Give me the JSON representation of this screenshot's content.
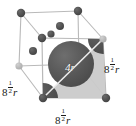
{
  "figure": {
    "type": "crystal-structure-diagram",
    "width": 136,
    "height": 126
  },
  "labels": {
    "edge_left": {
      "base": "8",
      "numerator": "1",
      "denominator": "2",
      "variable": "r",
      "full": "8^(1/2) r"
    },
    "edge_right": {
      "base": "8",
      "numerator": "1",
      "denominator": "2",
      "variable": "r",
      "full": "8^(1/2) r"
    },
    "edge_bottom": {
      "base": "8",
      "numerator": "1",
      "denominator": "2",
      "variable": "r",
      "full": "8^(1/2) r"
    },
    "diagonal": "4r"
  },
  "colors": {
    "cube_edge": "#b9b9b9",
    "cube_edge_dark": "#9a9a9a",
    "corner_atom_dark": "#4a4a4a",
    "corner_atom_light": "#b3b3b3",
    "interior_atom": "#5a5a5a",
    "central_sphere": "#575757",
    "quarter_sphere": "#4f4f4f",
    "shaded_face": "#c9c9c9",
    "diagonal_line": "#e8e8e8",
    "background": "#ffffff",
    "text": "#1a1a1a",
    "diagonal_text": "#ffffff"
  },
  "geometry": {
    "cube_vertices": {
      "back_top_left": [
        21,
        13
      ],
      "back_top_right": [
        78,
        11
      ],
      "back_bottom_left": [
        19,
        66
      ],
      "back_bottom_right": [
        79,
        64
      ],
      "front_top_left": [
        42,
        38
      ],
      "front_top_right": [
        103,
        39
      ],
      "front_bottom_left": [
        43,
        98
      ],
      "front_bottom_right": [
        106,
        98
      ]
    },
    "central_sphere": {
      "cx": 71,
      "cy": 64,
      "r": 23
    },
    "quarter_spheres": [
      {
        "corner": "front-bottom-left",
        "cx": 43,
        "cy": 98,
        "r": 15
      },
      {
        "corner": "front-top-right",
        "cx": 103,
        "cy": 39,
        "r": 15
      }
    ],
    "corner_atoms": [
      {
        "x": 21,
        "y": 13,
        "r": 4.2,
        "shade": "dark"
      },
      {
        "x": 78,
        "y": 11,
        "r": 4.2,
        "shade": "dark"
      },
      {
        "x": 19,
        "y": 66,
        "r": 3.6,
        "shade": "light"
      },
      {
        "x": 42,
        "y": 38,
        "r": 4.2,
        "shade": "dark"
      },
      {
        "x": 103,
        "y": 39,
        "r": 3.6,
        "shade": "light"
      },
      {
        "x": 43,
        "y": 98,
        "r": 4.2,
        "shade": "dark"
      },
      {
        "x": 106,
        "y": 98,
        "r": 4.2,
        "shade": "dark"
      }
    ],
    "interior_atoms": [
      {
        "x": 60,
        "y": 26,
        "r": 4.0
      },
      {
        "x": 51,
        "y": 34,
        "r": 3.6
      },
      {
        "x": 33,
        "y": 51,
        "r": 4.0
      }
    ],
    "face_diagonal": {
      "x1": 43,
      "y1": 98,
      "x2": 103,
      "y2": 39
    }
  }
}
